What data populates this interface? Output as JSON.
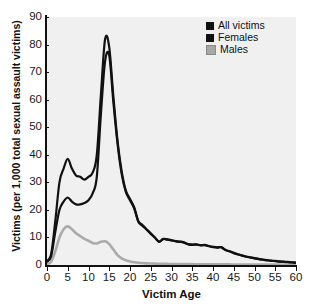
{
  "chart_data": {
    "type": "line",
    "title": "",
    "xlabel": "Victim Age",
    "ylabel": "Victims (per 1,000 total sexual assault victims)",
    "xlim": [
      0,
      60
    ],
    "ylim": [
      0,
      90
    ],
    "xticks": [
      0,
      5,
      10,
      15,
      20,
      25,
      30,
      35,
      40,
      45,
      50,
      55,
      60
    ],
    "yticks": [
      0,
      10,
      20,
      30,
      40,
      50,
      60,
      70,
      80,
      90
    ],
    "grid": false,
    "legend_position": "top-right",
    "x": [
      0,
      1,
      2,
      3,
      4,
      5,
      6,
      7,
      8,
      9,
      10,
      11,
      12,
      13,
      14,
      15,
      16,
      17,
      18,
      19,
      20,
      21,
      22,
      23,
      24,
      25,
      26,
      27,
      28,
      29,
      30,
      31,
      32,
      33,
      34,
      35,
      36,
      37,
      38,
      39,
      40,
      41,
      42,
      43,
      44,
      45,
      46,
      47,
      48,
      49,
      50,
      51,
      52,
      53,
      54,
      55,
      56,
      57,
      58,
      59,
      60
    ],
    "series": [
      {
        "name": "All victims",
        "color": "#111111",
        "values": [
          1.5,
          4,
          16,
          30,
          35,
          38.5,
          35,
          32.5,
          32,
          31,
          32,
          33.5,
          40,
          62,
          82,
          79,
          61,
          45,
          34,
          27,
          24,
          21,
          16,
          14.5,
          13,
          11.5,
          10,
          8.5,
          9.5,
          9.3,
          9,
          8.7,
          8.5,
          8.2,
          7.6,
          7.4,
          7.5,
          7.2,
          7.3,
          6.9,
          6.6,
          6.4,
          6.5,
          5.5,
          5,
          4.4,
          3.9,
          3.5,
          3.1,
          2.8,
          2.5,
          2.2,
          2,
          1.8,
          1.6,
          1.5,
          1.3,
          1.2,
          1.1,
          1,
          0.9
        ]
      },
      {
        "name": "Females",
        "color": "#111111",
        "values": [
          1.2,
          3.2,
          12,
          20,
          23,
          24.5,
          23,
          22,
          22,
          22.5,
          23.5,
          26,
          32,
          55,
          74,
          76,
          59,
          44,
          33,
          26.5,
          23.5,
          20.6,
          15.7,
          14.2,
          12.8,
          11.3,
          9.9,
          8.4,
          9.4,
          9.2,
          8.9,
          8.6,
          8.4,
          8.1,
          7.5,
          7.3,
          7.4,
          7.1,
          7.2,
          6.8,
          6.5,
          6.3,
          6.4,
          5.4,
          4.9,
          4.3,
          3.8,
          3.4,
          3,
          2.7,
          2.4,
          2.1,
          1.9,
          1.7,
          1.5,
          1.4,
          1.2,
          1.1,
          1,
          0.9,
          0.8
        ]
      },
      {
        "name": "Males",
        "color": "#aaaaaa",
        "values": [
          0.4,
          1.2,
          5,
          10,
          13,
          14,
          13,
          11.5,
          10.5,
          9.5,
          8.8,
          8,
          7.8,
          8.4,
          8.6,
          7.6,
          5.6,
          3.6,
          2.4,
          1.7,
          1.3,
          1,
          0.8,
          0.7,
          0.6,
          0.55,
          0.5,
          0.45,
          0.42,
          0.4,
          0.38,
          0.36,
          0.34,
          0.32,
          0.3,
          0.3,
          0.29,
          0.28,
          0.27,
          0.26,
          0.25,
          0.24,
          0.23,
          0.22,
          0.21,
          0.2,
          0.2,
          0.19,
          0.18,
          0.17,
          0.16,
          0.15,
          0.15,
          0.14,
          0.13,
          0.12,
          0.12,
          0.11,
          0.1,
          0.1,
          0.1
        ]
      }
    ]
  },
  "legend": {
    "items": [
      {
        "label": "All victims",
        "color": "#111111"
      },
      {
        "label": "Females",
        "color": "#111111"
      },
      {
        "label": "Males",
        "color": "#a8a8a8"
      }
    ]
  },
  "axes": {
    "x_title": "Victim Age",
    "y_title": "Victims (per 1,000 total sexual assault victims)",
    "x_tick_labels": [
      "0",
      "5",
      "10",
      "15",
      "20",
      "25",
      "30",
      "35",
      "40",
      "45",
      "50",
      "55",
      "60"
    ],
    "y_tick_labels": [
      "0",
      "10",
      "20",
      "30",
      "40",
      "50",
      "60",
      "70",
      "80",
      "90"
    ]
  }
}
